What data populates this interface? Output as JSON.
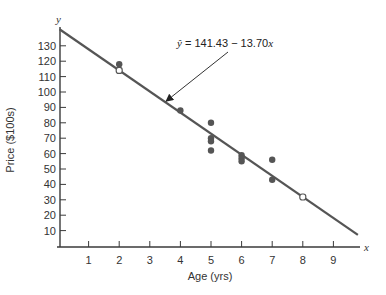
{
  "chart_data": {
    "type": "scatter",
    "title": "",
    "xlabel": "Age (yrs)",
    "ylabel": "Price ($100s)",
    "x_axis_letter": "x",
    "y_axis_letter": "y",
    "xlim": [
      0,
      9.9
    ],
    "ylim": [
      0,
      140
    ],
    "x_ticks": [
      1,
      2,
      3,
      4,
      5,
      6,
      7,
      8,
      9
    ],
    "y_ticks": [
      10,
      20,
      30,
      40,
      50,
      60,
      70,
      80,
      90,
      100,
      110,
      120,
      130
    ],
    "grid": false,
    "legend": null,
    "series": [
      {
        "name": "observed",
        "marker": "filled-circle",
        "points": [
          {
            "x": 2,
            "y": 118
          },
          {
            "x": 4,
            "y": 88
          },
          {
            "x": 5,
            "y": 80
          },
          {
            "x": 5,
            "y": 70
          },
          {
            "x": 5,
            "y": 68
          },
          {
            "x": 5,
            "y": 62
          },
          {
            "x": 6,
            "y": 59
          },
          {
            "x": 6,
            "y": 57
          },
          {
            "x": 6,
            "y": 55
          },
          {
            "x": 7,
            "y": 56
          },
          {
            "x": 7,
            "y": 43
          }
        ]
      },
      {
        "name": "fitted-points",
        "marker": "open-circle",
        "points": [
          {
            "x": 2,
            "y": 114.03
          },
          {
            "x": 8,
            "y": 31.83
          }
        ]
      }
    ],
    "regression": {
      "intercept": 141.43,
      "slope": -13.7,
      "x_range": [
        0,
        9.9
      ]
    },
    "annotations": [
      {
        "text": "ŷ = 141.43 − 13.70x",
        "points_to": {
          "x": 3.6,
          "y": 92.1
        }
      }
    ]
  },
  "labels": {
    "equation_yhat": "ŷ",
    "equation_rest": " = 141.43 − 13.70",
    "equation_x": "x"
  }
}
